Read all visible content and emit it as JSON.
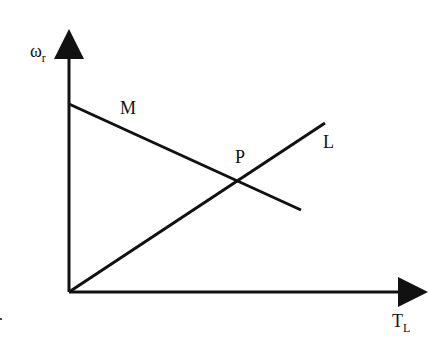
{
  "diagram": {
    "y_axis_label": {
      "symbol": "ω",
      "subscript": "r"
    },
    "x_axis_label": {
      "symbol": "T",
      "subscript": "L"
    },
    "lines": [
      {
        "name": "M",
        "label": "M",
        "from": [
          69,
          104
        ],
        "to": [
          301,
          210
        ]
      },
      {
        "name": "L",
        "label": "L",
        "from": [
          69,
          292
        ],
        "to": [
          325,
          123
        ]
      }
    ],
    "intersection": {
      "label": "P",
      "point": [
        237,
        180
      ]
    },
    "colors": {
      "stroke": "#111111",
      "background": "#ffffff"
    }
  }
}
